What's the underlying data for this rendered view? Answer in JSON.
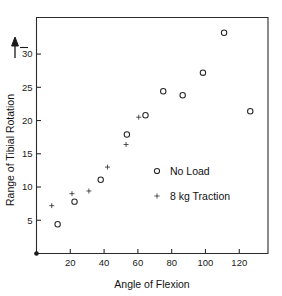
{
  "chart_data": {
    "type": "scatter",
    "title": "",
    "xlabel": "Angle of Flexion",
    "ylabel": "Range of Tibial Rotation",
    "xlim": [
      0,
      137
    ],
    "ylim": [
      0,
      35.5
    ],
    "xticks": [
      20,
      40,
      60,
      80,
      100,
      120
    ],
    "yticks": [
      5,
      10,
      15,
      20,
      25,
      30
    ],
    "xtick_labels": [
      "20",
      "40",
      "60",
      "80",
      "100",
      "120"
    ],
    "ytick_labels": [
      "5",
      "10",
      "15",
      "20",
      "25",
      "30"
    ],
    "grid": false,
    "legend_position": "center-right",
    "ylabel_arrow": "upward-arrow",
    "series": [
      {
        "name": "No Load",
        "marker": "open-circle",
        "points": [
          {
            "x": 12.5,
            "y": 4.4
          },
          {
            "x": 22.5,
            "y": 7.8
          },
          {
            "x": 38.0,
            "y": 11.1
          },
          {
            "x": 53.5,
            "y": 17.9
          },
          {
            "x": 64.5,
            "y": 20.8
          },
          {
            "x": 75.0,
            "y": 24.4
          },
          {
            "x": 86.5,
            "y": 23.8
          },
          {
            "x": 98.5,
            "y": 27.2
          },
          {
            "x": 111.0,
            "y": 33.2
          },
          {
            "x": 126.5,
            "y": 21.4
          }
        ]
      },
      {
        "name": "8 kg Traction",
        "marker": "small-plus",
        "points": [
          {
            "x": 9.0,
            "y": 7.2
          },
          {
            "x": 21.0,
            "y": 9.0
          },
          {
            "x": 31.0,
            "y": 9.4
          },
          {
            "x": 42.0,
            "y": 13.0
          },
          {
            "x": 53.0,
            "y": 16.4
          },
          {
            "x": 60.5,
            "y": 20.5
          }
        ]
      }
    ],
    "origin_marker": {
      "x": 0,
      "y": 0,
      "marker": "filled-dot"
    }
  },
  "legend": {
    "entries": [
      {
        "label": "No Load",
        "marker": "open-circle"
      },
      {
        "label": "8 kg Traction",
        "marker": "small-plus"
      }
    ]
  },
  "axes": {
    "x_title": "Angle of Flexion",
    "y_title": "Range of Tibial Rotation"
  }
}
